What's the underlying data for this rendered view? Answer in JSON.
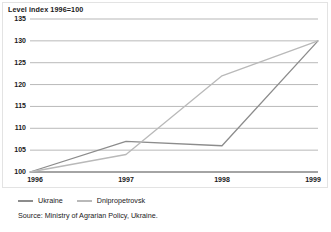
{
  "chart_data": {
    "type": "line",
    "title": "Level index 1996=100",
    "xlabel": "",
    "ylabel": "",
    "x": [
      "1996",
      "1997",
      "1998",
      "1999"
    ],
    "categories": [
      "1996",
      "1997",
      "1998",
      "1999"
    ],
    "ylim": [
      100,
      135
    ],
    "ytick_labels": [
      "100",
      "105",
      "110",
      "115",
      "120",
      "125",
      "130",
      "135"
    ],
    "ytick_values": [
      100,
      105,
      110,
      115,
      120,
      125,
      130,
      135
    ],
    "grid": true,
    "grid_axis": "y",
    "legend_position": "bottom-left",
    "series": [
      {
        "name": "Ukraine",
        "values": [
          100,
          107,
          106,
          130
        ],
        "color": "#8c8c8c"
      },
      {
        "name": "Dnipropetrovsk",
        "values": [
          100,
          104,
          122,
          130
        ],
        "color": "#b9b9b9"
      }
    ],
    "source": "Source: Ministry of Agrarian Policy, Ukraine."
  },
  "colors": {
    "grid": "#9a9a9a",
    "axis": "#4a4a4a",
    "frame": "#e3e3e3",
    "text": "#1a1a1a",
    "background": "#ffffff"
  }
}
